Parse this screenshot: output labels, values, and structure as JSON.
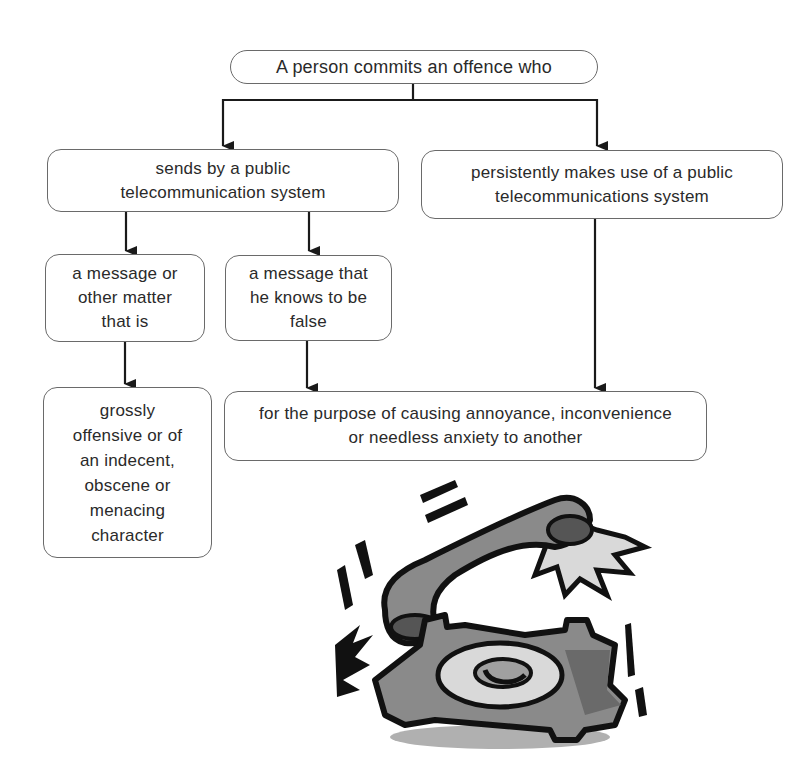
{
  "diagram": {
    "title_node": "A person commits an offence who",
    "branches": {
      "left": {
        "label": "sends by a public\ntelecommunication system",
        "children": [
          {
            "label": "a message or\nother matter\nthat is",
            "next": "grossly\noffensive or of\nan indecent,\nobscene or\nmenacing\ncharacter"
          },
          {
            "label": "a message that\nhe knows to be\nfalse",
            "next": "purpose"
          }
        ]
      },
      "right": {
        "label": "persistently makes use of a public\ntelecommunications system",
        "next": "purpose"
      }
    },
    "purpose_node": "for the purpose of causing annoyance, inconvenience\nor needless anxiety to another"
  },
  "illustration": {
    "icon": "ringing-telephone-icon",
    "description": "Cartoon rotary telephone with handset jumping off, ringing"
  },
  "colors": {
    "line": "#1a1a1a",
    "box_border": "#6a6a6a",
    "phone_body": "#8a8a8a",
    "phone_shadow": "#b0b0b0"
  }
}
